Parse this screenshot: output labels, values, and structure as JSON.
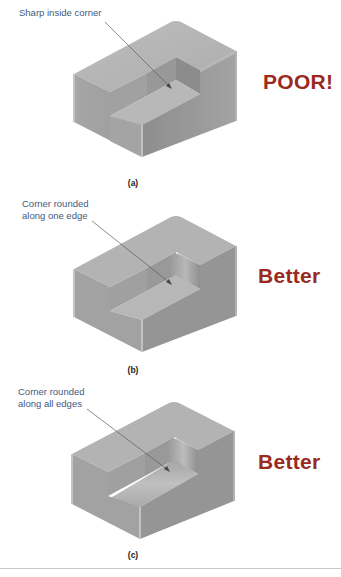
{
  "panels": [
    {
      "id": "a",
      "callout": [
        "Sharp inside corner"
      ],
      "verdict": "POOR!",
      "caption": "(a)",
      "corner_style": "sharp"
    },
    {
      "id": "b",
      "callout": [
        "Corner rounded",
        "along one edge"
      ],
      "verdict": "Better",
      "caption": "(b)",
      "corner_style": "rounded-one-edge"
    },
    {
      "id": "c",
      "callout": [
        "Corner rounded",
        "along all edges"
      ],
      "verdict": "Better",
      "caption": "(c)",
      "corner_style": "rounded-all-edges"
    }
  ],
  "colors": {
    "callout_text": "#3f5a7e",
    "verdict_text": "#9a2a1e",
    "block_top": "#b4b4b4",
    "block_left": "#a2a2a2",
    "block_right": "#9a9a9a"
  }
}
